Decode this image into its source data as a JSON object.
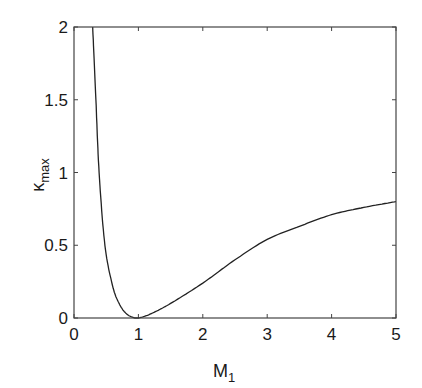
{
  "chart_data": {
    "type": "line",
    "title": "",
    "xlabel": "M",
    "xlabel_sub": "1",
    "ylabel": "κ",
    "ylabel_sub": "max",
    "xlim": [
      0,
      5
    ],
    "ylim": [
      0,
      2
    ],
    "grid": false,
    "legend": null,
    "x_ticks": [
      "0",
      "1",
      "2",
      "3",
      "4",
      "5"
    ],
    "y_ticks": [
      "0",
      "0.5",
      "1",
      "1.5",
      "2"
    ],
    "series": [
      {
        "name": "kappa_max",
        "x": [
          0.29,
          0.34,
          0.39,
          0.48,
          0.6,
          0.7,
          0.8,
          0.9,
          1.0,
          1.2,
          1.5,
          2.0,
          2.5,
          3.0,
          3.5,
          4.0,
          4.5,
          5.0
        ],
        "y": [
          2.0,
          1.5,
          1.0,
          0.5,
          0.22,
          0.1,
          0.035,
          0.007,
          0.0,
          0.03,
          0.1,
          0.24,
          0.4,
          0.54,
          0.63,
          0.71,
          0.76,
          0.8
        ]
      }
    ]
  }
}
